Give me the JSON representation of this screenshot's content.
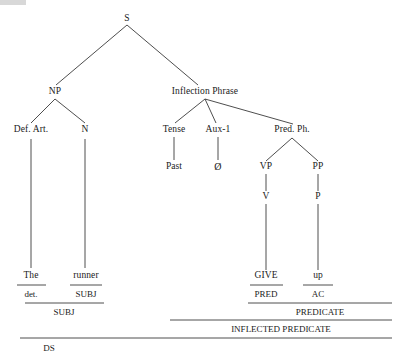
{
  "diagram": {
    "type": "syntactic-tree",
    "line_color": "#3a3a3a",
    "text_color": "#1a1a1a",
    "background": "#ffffff",
    "sentence": "The runner gave up"
  },
  "nodes": {
    "s": "S",
    "np": "NP",
    "inflection_phrase": "Inflection Phrase",
    "def_art": "Def. Art.",
    "n": "N",
    "tense": "Tense",
    "aux1": "Aux-1",
    "pred_ph": "Pred. Ph.",
    "past": "Past",
    "null": "Ø",
    "vp": "VP",
    "pp": "PP",
    "v": "V",
    "p": "P"
  },
  "terminals": {
    "the": "The",
    "runner": "runner",
    "give": "GIVE",
    "up": "up"
  },
  "function_labels": {
    "det": "det.",
    "subj_n": "SUBJ",
    "pred": "PRED",
    "ac": "AC"
  },
  "bracket_labels": {
    "subj_phrase": "SUBJ",
    "predicate": "PREDICATE",
    "inflected_predicate": "INFLECTED PREDICATE",
    "ds": "DS"
  }
}
